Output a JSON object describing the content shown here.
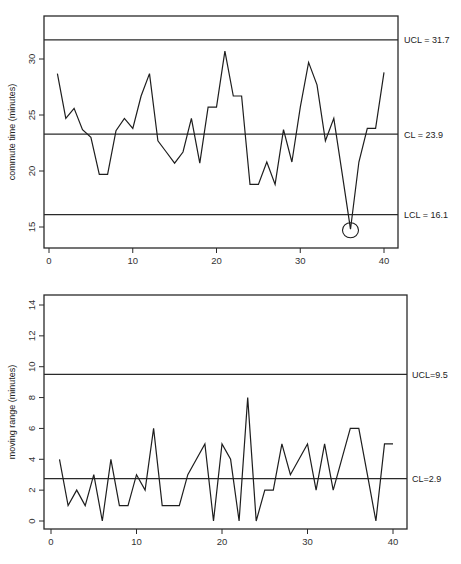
{
  "chart_data": [
    {
      "type": "line",
      "title": "",
      "xlabel": "",
      "ylabel": "commute time (minutes)",
      "xlim": [
        -1,
        42
      ],
      "ylim": [
        13,
        33.5
      ],
      "xticks": [
        0,
        10,
        20,
        30,
        40
      ],
      "xtick_labels": [
        "0",
        "10",
        "20",
        "30",
        "40"
      ],
      "yticks": [
        15,
        20,
        25,
        30
      ],
      "ytick_labels": [
        "15",
        "20",
        "25",
        "30"
      ],
      "grid": false,
      "series": [
        {
          "name": "commute time",
          "x": [
            1,
            2,
            3,
            4,
            5,
            6,
            7,
            8,
            9,
            10,
            11,
            12,
            13,
            14,
            15,
            16,
            17,
            18,
            19,
            20,
            21,
            22,
            23,
            24,
            25,
            26,
            27,
            28,
            29,
            30,
            31,
            32,
            33,
            34,
            35,
            36,
            37,
            38,
            39,
            40
          ],
          "values": [
            28.7,
            24.7,
            25.6,
            23.7,
            23.0,
            19.7,
            19.7,
            23.6,
            24.7,
            23.8,
            26.7,
            28.7,
            22.7,
            21.7,
            20.7,
            21.7,
            24.7,
            20.7,
            25.7,
            25.7,
            30.7,
            26.7,
            26.7,
            18.8,
            18.8,
            20.8,
            18.8,
            23.7,
            20.8,
            25.7,
            29.7,
            27.7,
            22.7,
            24.7,
            19.8,
            14.8,
            20.8,
            23.8,
            23.8,
            28.8
          ]
        }
      ],
      "control_lines": [
        {
          "name": "UCL",
          "value": 31.7,
          "label": "UCL = 31.7"
        },
        {
          "name": "CL",
          "value": 23.3,
          "label": "CL = 23.9"
        },
        {
          "name": "LCL",
          "value": 16.1,
          "label": "LCL = 16.1"
        }
      ],
      "annotations": [
        {
          "type": "circle",
          "x": 36,
          "y": 14.8,
          "note": "out-of-control point"
        }
      ]
    },
    {
      "type": "line",
      "title": "",
      "xlabel": "",
      "ylabel": "moving range (minutes)",
      "xlim": [
        -1,
        42
      ],
      "ylim": [
        -0.5,
        14.7
      ],
      "xticks": [
        0,
        10,
        20,
        30,
        40
      ],
      "xtick_labels": [
        "0",
        "10",
        "20",
        "30",
        "40"
      ],
      "yticks": [
        0,
        2,
        4,
        6,
        8,
        10,
        12,
        14
      ],
      "ytick_labels": [
        "0",
        "2",
        "4",
        "6",
        "8",
        "10",
        "12",
        "14"
      ],
      "grid": false,
      "series": [
        {
          "name": "moving range",
          "x": [
            1,
            2,
            3,
            4,
            5,
            6,
            7,
            8,
            9,
            10,
            11,
            12,
            13,
            14,
            15,
            16,
            17,
            18,
            19,
            20,
            21,
            22,
            23,
            24,
            25,
            26,
            27,
            28,
            29,
            30,
            31,
            32,
            33,
            34,
            35,
            36,
            37,
            38,
            39,
            40
          ],
          "values": [
            4,
            1,
            2,
            1,
            3,
            0,
            4,
            1,
            1,
            3,
            2,
            6,
            1,
            1,
            1,
            3,
            4,
            5,
            0,
            5,
            4,
            0,
            8,
            0,
            2,
            2,
            5,
            3,
            4,
            5,
            2,
            5,
            2,
            4,
            6,
            6,
            3,
            0,
            5,
            5
          ]
        }
      ],
      "control_lines": [
        {
          "name": "UCL",
          "value": 9.5,
          "label": "UCL=9.5"
        },
        {
          "name": "CL",
          "value": 2.75,
          "label": "CL=2.9"
        }
      ]
    }
  ]
}
